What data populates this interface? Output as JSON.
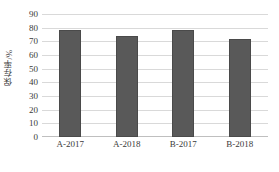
{
  "chart_data": {
    "type": "bar",
    "title": "",
    "subtitle": "",
    "xlabel": "",
    "ylabel": "保存率/%",
    "categories": [
      "A-2017",
      "A-2018",
      "B-2017",
      "B-2018"
    ],
    "values": [
      78,
      74,
      78,
      72
    ],
    "series": [
      {
        "name": "保存率",
        "values": [
          78,
          74,
          78,
          72
        ]
      }
    ],
    "ylim": [
      0,
      90
    ],
    "ytick_step": 10,
    "yticks": [
      90,
      80,
      70,
      60,
      50,
      40,
      30,
      20,
      10,
      0
    ],
    "ytick_labels": [
      "90",
      "80",
      "70",
      "60",
      "50",
      "40",
      "30",
      "20",
      "10",
      "0"
    ],
    "grid": true,
    "grid_axis": "y",
    "legend": false,
    "legend_position": "none",
    "bar_color": "#595959",
    "grid_color": "#d9d9d9",
    "axis_color": "#bfbfbf",
    "text_color": "#3a3a3a",
    "background": "#ffffff",
    "annotations": []
  }
}
